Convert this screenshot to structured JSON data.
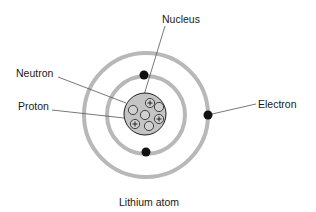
{
  "title": "Lithium atom",
  "labels": {
    "nucleus": "Nucleus",
    "neutron": "Neutron",
    "proton": "Proton",
    "electron": "Electron"
  },
  "colors": {
    "orbit": "#b8b8b8",
    "electron": "#111111",
    "nucleus_fill": "#c4c4c4",
    "particle_fill": "#d0d0d0",
    "leader": "#555555"
  },
  "atom": {
    "center": [
      145,
      115
    ],
    "inner_orbit_radius": 39,
    "outer_orbit_radius": 62,
    "nucleus_radius": 21,
    "electrons": [
      {
        "shell": "inner",
        "position": "top"
      },
      {
        "shell": "inner",
        "position": "bottom"
      },
      {
        "shell": "outer",
        "position": "right"
      }
    ],
    "particles": [
      {
        "type": "proton",
        "symbol": "+"
      },
      {
        "type": "neutron",
        "symbol": ""
      },
      {
        "type": "neutron",
        "symbol": ""
      },
      {
        "type": "neutron",
        "symbol": ""
      },
      {
        "type": "proton",
        "symbol": "+"
      },
      {
        "type": "proton",
        "symbol": "+"
      },
      {
        "type": "neutron",
        "symbol": ""
      }
    ]
  }
}
